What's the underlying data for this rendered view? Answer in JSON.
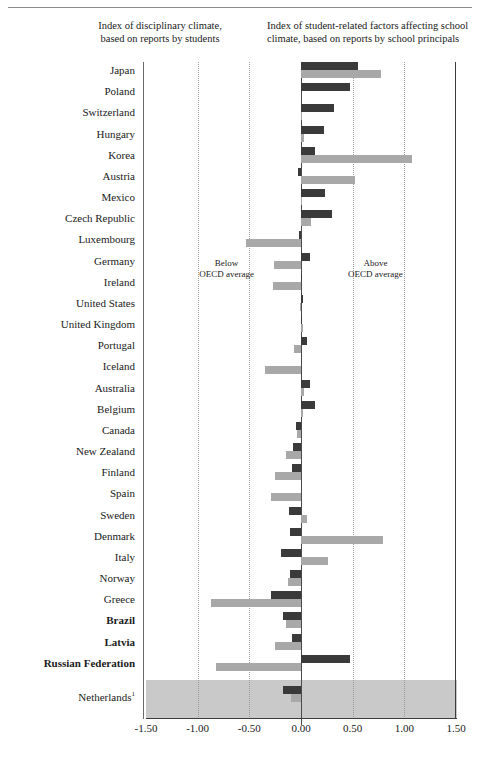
{
  "figure": {
    "cut_title": "",
    "legend": [
      {
        "label": "Index of disciplinary climate,\nbased on reports by students",
        "line1": "Index of disciplinary climate,",
        "line2": "based on reports by students",
        "color": "#3a3a3a",
        "swatch_name": "legend-swatch-dark"
      },
      {
        "label": "Index of student-related factors affecting school\nclimate, based on reports by school principals",
        "line1": "Index of student-related factors affecting school",
        "line2": "climate, based on reports by school principals",
        "color": "#a8a8a8",
        "swatch_name": "legend-swatch-light"
      }
    ],
    "annotations": {
      "below": {
        "line1": "Below",
        "line2": "OECD average"
      },
      "above": {
        "line1": "Above",
        "line2": "OECD average"
      }
    },
    "footnote_marker": "1"
  },
  "chart_data": {
    "type": "bar",
    "orientation": "horizontal",
    "title": "",
    "xlabel": "",
    "ylabel": "",
    "xlim": [
      -1.5,
      1.5
    ],
    "xticks": [
      "-1.50",
      "-1.00",
      "-0.50",
      "0.00",
      "0.50",
      "1.00",
      "1.50"
    ],
    "xtick_values": [
      -1.5,
      -1.0,
      -0.5,
      0.0,
      0.5,
      1.0,
      1.5
    ],
    "grid": true,
    "legend_position": "top",
    "reference_line": 0.0,
    "categories": [
      "Japan",
      "Poland",
      "Switzerland",
      "Hungary",
      "Korea",
      "Austria",
      "Mexico",
      "Czech Republic",
      "Luxembourg",
      "Germany",
      "Ireland",
      "United States",
      "United Kingdom",
      "Portugal",
      "Iceland",
      "Australia",
      "Belgium",
      "Canada",
      "New Zealand",
      "Finland",
      "Spain",
      "Sweden",
      "Denmark",
      "Italy",
      "Norway",
      "Greece",
      "Brazil",
      "Latvia",
      "Russian Federation",
      "Netherlands"
    ],
    "bold_categories": [
      "Brazil",
      "Latvia",
      "Russian Federation"
    ],
    "highlighted_categories": [
      "Netherlands"
    ],
    "footnoted_categories": [
      "Netherlands"
    ],
    "series": [
      {
        "name": "Index of disciplinary climate, based on reports by students",
        "color": "#3a3a3a",
        "values": [
          0.55,
          0.47,
          0.32,
          0.22,
          0.14,
          -0.03,
          0.23,
          0.3,
          -0.02,
          0.09,
          0.01,
          0.02,
          0.01,
          0.06,
          0.0,
          0.09,
          0.14,
          -0.05,
          -0.08,
          -0.09,
          0.0,
          -0.12,
          -0.11,
          -0.19,
          -0.11,
          -0.29,
          -0.17,
          -0.09,
          0.47,
          -0.17
        ]
      },
      {
        "name": "Index of student-related factors affecting school climate, based on reports by school principals",
        "color": "#a8a8a8",
        "values": [
          0.77,
          0.0,
          0.01,
          0.03,
          1.07,
          0.52,
          0.01,
          0.1,
          -0.53,
          -0.26,
          -0.27,
          -0.01,
          0.02,
          -0.07,
          -0.35,
          0.03,
          0.02,
          -0.04,
          -0.15,
          -0.25,
          -0.29,
          0.06,
          0.79,
          0.26,
          -0.13,
          -0.87,
          -0.15,
          -0.25,
          -0.82,
          -0.1
        ]
      }
    ]
  }
}
